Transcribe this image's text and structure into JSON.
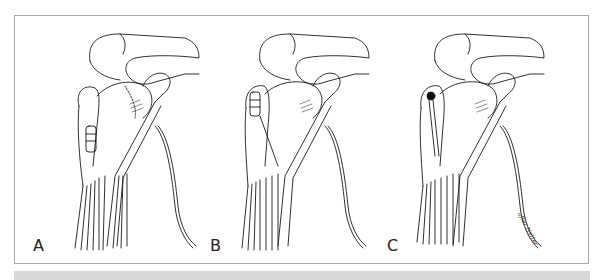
{
  "figure": {
    "panels": [
      {
        "label": "A",
        "variant": "tendon-detached-low"
      },
      {
        "label": "B",
        "variant": "tendon-retracted-high"
      },
      {
        "label": "C",
        "variant": "tendon-absent-dark-groove"
      }
    ],
    "signature": "after Netter",
    "colors": {
      "line": "#1a1a1a",
      "frame": "#a9a9a9",
      "band": "#d8d8d8",
      "background": "#ffffff"
    }
  }
}
